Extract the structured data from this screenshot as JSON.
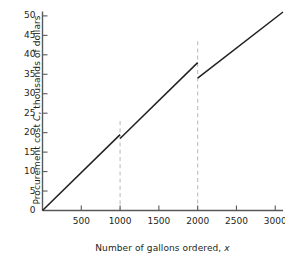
{
  "chart_data": {
    "type": "line",
    "title": "",
    "xlabel": "Number of gallons ordered, x",
    "xlabel_plain": "Number of gallons ordered,",
    "xlabel_italic": "x",
    "ylabel": "Procurement cost C, thousands of dollars",
    "ylabel_pre": "Procurement cost",
    "ylabel_italic": "C",
    "ylabel_post": ", thousands of dollars",
    "xlim": [
      0,
      3100
    ],
    "ylim": [
      0,
      51
    ],
    "xticks": [
      500,
      1000,
      1500,
      2000,
      2500,
      3000
    ],
    "xtick_labels": [
      "500",
      "1000",
      "1500",
      "2000",
      "2500",
      "3000"
    ],
    "yticks": [
      0,
      5,
      10,
      15,
      20,
      25,
      30,
      35,
      40,
      45,
      50
    ],
    "ytick_labels": [
      "0",
      "5",
      "10",
      "15",
      "20",
      "25",
      "30",
      "35",
      "40",
      "45",
      "50"
    ],
    "grid": false,
    "legend": "none",
    "line_color": "#231f20",
    "axis_color": "#58595b",
    "guide_color": "#bcbec0",
    "series": [
      {
        "name": "Procurement cost",
        "piecewise": true,
        "segments": [
          {
            "x": [
              0,
              1000
            ],
            "y": [
              0,
              19.5
            ],
            "note": "tier 1: 0-1000 gallons"
          },
          {
            "x": [
              1000,
              2000
            ],
            "y": [
              18.5,
              38.0
            ],
            "note": "tier 2: 1000-2000 gallons"
          },
          {
            "x": [
              2000,
              3100
            ],
            "y": [
              34.0,
              51.0
            ],
            "note": "tier 3: over 2000 gallons"
          }
        ]
      }
    ],
    "discontinuities": [
      {
        "x": 1000,
        "y_left": 19.5,
        "y_right": 18.5,
        "jump": -1.0
      },
      {
        "x": 2000,
        "y_left": 38.0,
        "y_right": 34.0,
        "jump": -4.0
      }
    ],
    "guide_lines": [
      {
        "x": 1000,
        "y_top": 23.0,
        "y_bottom": 0,
        "style": "dashed"
      },
      {
        "x": 2000,
        "y_top": 43.5,
        "y_bottom": 0,
        "style": "dashed"
      }
    ]
  }
}
